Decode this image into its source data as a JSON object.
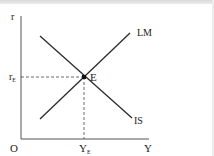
{
  "diagram": {
    "axes": {
      "y_label": "r",
      "x_label": "Y",
      "origin_label": "O"
    },
    "equilibrium": {
      "point_label": "E",
      "r_label": "r",
      "r_subscript": "E",
      "y_label": "Y",
      "y_subscript": "E"
    },
    "curves": [
      {
        "name": "LM",
        "label": "LM",
        "slope": "upward"
      },
      {
        "name": "IS",
        "label": "IS",
        "slope": "downward"
      }
    ],
    "colors": {
      "line": "#2b2b2b",
      "axis": "#555555",
      "dashed": "#444444",
      "background": "#ffffff"
    }
  }
}
